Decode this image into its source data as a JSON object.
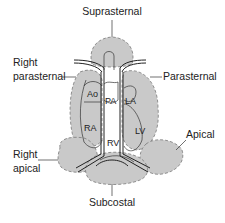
{
  "diagram": {
    "type": "echocardiography acoustic windows",
    "windows": [
      {
        "id": "suprasternal",
        "label": "Suprasternal"
      },
      {
        "id": "right-parasternal",
        "label_line1": "Right",
        "label_line2": "parasternal"
      },
      {
        "id": "parasternal",
        "label": "Parasternal"
      },
      {
        "id": "right-apical",
        "label_line1": "Right",
        "label_line2": "apical"
      },
      {
        "id": "apical",
        "label": "Apical"
      },
      {
        "id": "subcostal",
        "label": "Subcostal"
      }
    ],
    "structures": {
      "ao": "Ao",
      "pa": "PA",
      "la": "LA",
      "ra": "RA",
      "rv": "RV",
      "lv": "LV"
    },
    "colors": {
      "window_fill": "#c9c9c9",
      "window_stroke": "#7a7a7a",
      "line": "#222222"
    }
  }
}
